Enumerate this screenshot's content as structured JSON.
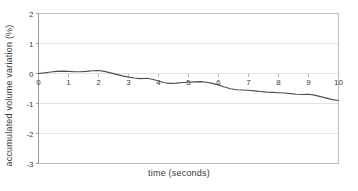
{
  "chart_data": {
    "type": "line",
    "title": "",
    "subtitle": "",
    "xlabel": "time (seconds)",
    "ylabel": "accumulated volume variation (%)",
    "xlim": [
      0,
      10
    ],
    "ylim": [
      -3,
      2
    ],
    "xticks": [
      0,
      1,
      2,
      3,
      4,
      5,
      6,
      7,
      8,
      9,
      10
    ],
    "xtick_labels": [
      "0",
      "1",
      "2",
      "3",
      "4",
      "5",
      "6",
      "7",
      "8",
      "9",
      "10"
    ],
    "yticks": [
      2,
      1,
      0,
      -1,
      -2,
      -3
    ],
    "ytick_labels": [
      "2",
      "1",
      "0",
      "-1",
      "-2",
      "-3"
    ],
    "grid": {
      "horizontal": true,
      "vertical": false,
      "color": "#e3e3e3"
    },
    "legend": {
      "visible": false,
      "position": "none",
      "entries": []
    },
    "annotations": [],
    "series": [
      {
        "name": "accumulated volume variation",
        "color": "#4d4d4d",
        "line_width": 1.1,
        "markers": false,
        "x": [
          0.0,
          0.2,
          0.4,
          0.6,
          0.8,
          1.0,
          1.2,
          1.4,
          1.6,
          1.8,
          2.0,
          2.2,
          2.4,
          2.6,
          2.8,
          3.0,
          3.2,
          3.4,
          3.6,
          3.8,
          4.0,
          4.2,
          4.4,
          4.6,
          4.8,
          5.0,
          5.2,
          5.4,
          5.6,
          5.8,
          6.0,
          6.2,
          6.4,
          6.6,
          6.8,
          7.0,
          7.2,
          7.4,
          7.6,
          7.8,
          8.0,
          8.2,
          8.4,
          8.6,
          8.8,
          9.0,
          9.2,
          9.4,
          9.6,
          9.8,
          10.0
        ],
        "y": [
          0.0,
          0.02,
          0.05,
          0.07,
          0.08,
          0.07,
          0.06,
          0.06,
          0.07,
          0.09,
          0.1,
          0.07,
          0.02,
          -0.03,
          -0.08,
          -0.12,
          -0.15,
          -0.17,
          -0.16,
          -0.19,
          -0.25,
          -0.31,
          -0.33,
          -0.32,
          -0.3,
          -0.29,
          -0.28,
          -0.27,
          -0.29,
          -0.33,
          -0.38,
          -0.45,
          -0.51,
          -0.54,
          -0.55,
          -0.56,
          -0.58,
          -0.6,
          -0.62,
          -0.63,
          -0.64,
          -0.65,
          -0.67,
          -0.69,
          -0.7,
          -0.69,
          -0.72,
          -0.77,
          -0.82,
          -0.87,
          -0.9
        ]
      }
    ]
  }
}
